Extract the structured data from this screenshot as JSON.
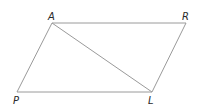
{
  "diagram": {
    "type": "parallelogram-with-diagonal",
    "line_color": "#9a9a9a",
    "label_color": "#2a2a2a",
    "vertices": {
      "A": {
        "label": "A",
        "x": 52,
        "y": 23
      },
      "R": {
        "label": "R",
        "x": 186,
        "y": 23
      },
      "L": {
        "label": "L",
        "x": 152,
        "y": 92
      },
      "P": {
        "label": "P",
        "x": 17,
        "y": 92
      }
    },
    "edges": [
      {
        "from": "A",
        "to": "R"
      },
      {
        "from": "R",
        "to": "L"
      },
      {
        "from": "L",
        "to": "P"
      },
      {
        "from": "P",
        "to": "A"
      },
      {
        "from": "A",
        "to": "L",
        "kind": "diagonal"
      }
    ]
  }
}
